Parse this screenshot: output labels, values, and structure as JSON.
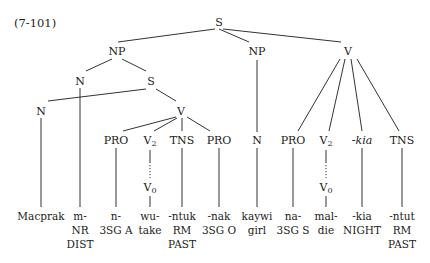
{
  "example_number": "(7-101)",
  "nodes": {
    "root": "S",
    "np1": "NP",
    "np2": "NP",
    "v_right": "V",
    "n_a": "N",
    "s_inner": "S",
    "n_b": "N",
    "v_inner": "V",
    "pro1": "PRO",
    "v2_1": "V",
    "v2_1_sub": "2",
    "tns1": "TNS",
    "pro2": "PRO",
    "n_mid": "N",
    "pro3": "PRO",
    "v2_2": "V",
    "v2_2_sub": "2",
    "kia": "-kia",
    "tns2": "TNS",
    "v0_1": "V",
    "v0_1_sub": "0",
    "v0_2": "V",
    "v0_2_sub": "0"
  },
  "leaves": [
    {
      "form": "Macprak",
      "gloss1": "",
      "gloss2": ""
    },
    {
      "form": "m-",
      "gloss1": "NR",
      "gloss2": "DIST"
    },
    {
      "form": "n-",
      "gloss1": "3SG A",
      "gloss2": ""
    },
    {
      "form": "wu-",
      "gloss1": "take",
      "gloss2": ""
    },
    {
      "form": "-ntuk",
      "gloss1": "RM",
      "gloss2": "PAST"
    },
    {
      "form": "-nak",
      "gloss1": "3SG O",
      "gloss2": ""
    },
    {
      "form": "kaywi",
      "gloss1": "girl",
      "gloss2": ""
    },
    {
      "form": "na-",
      "gloss1": "3SG S",
      "gloss2": ""
    },
    {
      "form": "mal-",
      "gloss1": "die",
      "gloss2": ""
    },
    {
      "form": "-kia",
      "gloss1": "NIGHT",
      "gloss2": ""
    },
    {
      "form": "-ntut",
      "gloss1": "RM",
      "gloss2": "PAST"
    }
  ]
}
